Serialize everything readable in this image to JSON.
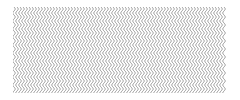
{
  "pattern": {
    "type": "vertical-wavy-lines",
    "line_color": "#8a8a8a",
    "background_color": "#ffffff",
    "line_spacing_px": 3,
    "wave_amplitude_px": 1.2,
    "wave_period_px": 8,
    "bounds": {
      "x": 13,
      "y": 7,
      "width": 214,
      "height": 86
    }
  }
}
